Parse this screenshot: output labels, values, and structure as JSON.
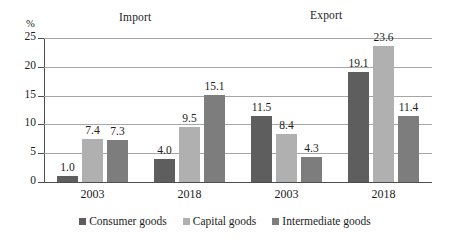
{
  "chart_data": {
    "type": "bar",
    "title": "",
    "xlabel": "",
    "ylabel": "%",
    "ylim": [
      0,
      25
    ],
    "yticks": [
      0,
      5,
      10,
      15,
      20,
      25
    ],
    "ytick_labels": [
      "0",
      "5",
      "10",
      "15",
      "20",
      "25"
    ],
    "grid": true,
    "legend_position": "bottom",
    "categories": [
      "2003",
      "2018",
      "2003",
      "2018"
    ],
    "group_headers": [
      {
        "label": "Import",
        "categories": [
          "2003",
          "2018"
        ]
      },
      {
        "label": "Export",
        "categories": [
          "2003",
          "2018"
        ]
      }
    ],
    "series": [
      {
        "name": "Consumer goods",
        "color": "#5e5e5e",
        "values": [
          1.0,
          4.0,
          11.5,
          19.1
        ],
        "labels": [
          "1.0",
          "4.0",
          "11.5",
          "19.1"
        ]
      },
      {
        "name": "Capital goods",
        "color": "#b0b0b0",
        "values": [
          7.4,
          9.5,
          8.4,
          23.6
        ],
        "labels": [
          "7.4",
          "9.5",
          "8.4",
          "23.6"
        ]
      },
      {
        "name": "Intermediate goods",
        "color": "#7d7d7d",
        "values": [
          7.3,
          15.1,
          4.3,
          11.4
        ],
        "labels": [
          "7.3",
          "15.1",
          "4.3",
          "11.4"
        ]
      }
    ]
  },
  "axis": {
    "unit_label": "%"
  },
  "legend": {
    "items": [
      {
        "label": "Consumer goods",
        "color": "#5e5e5e"
      },
      {
        "label": "Capital goods",
        "color": "#b0b0b0"
      },
      {
        "label": "Intermediate goods",
        "color": "#7d7d7d"
      }
    ]
  },
  "colors": {
    "gridline": "#a6a6a6",
    "axis": "#4d4d4d",
    "text": "#1c1c1c",
    "background": "#ffffff"
  }
}
